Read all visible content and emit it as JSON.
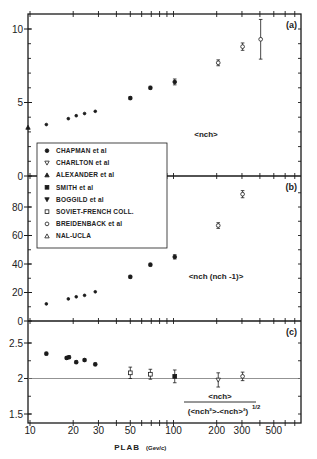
{
  "chart_data": [
    {
      "panel": "(a)",
      "type": "scatter",
      "xscale": "log",
      "xlabel": "PLAB (Gev/c)",
      "ylabel": "",
      "annotation": "<nch>",
      "ylim": [
        0,
        10.5
      ],
      "yticks": [
        0,
        5,
        10
      ],
      "xticks": [
        10,
        20,
        30,
        50,
        100,
        200,
        300,
        500
      ],
      "xlim": [
        10,
        800
      ],
      "series": [
        {
          "name": "CHAPMAN et al",
          "marker": "filled-circle",
          "x": [
            13,
            18.5,
            21,
            24,
            28.5
          ],
          "y": [
            3.5,
            3.9,
            4.1,
            4.25,
            4.4
          ]
        },
        {
          "name": "ALEXANDER et al",
          "marker": "filled-triangle",
          "x": [
            10
          ],
          "y": [
            3.3
          ]
        },
        {
          "name": "SOVIET-FRENCH COLL.",
          "marker": "filled-circle",
          "x": [
            50,
            69,
            102
          ],
          "y": [
            5.3,
            6.0,
            6.4
          ],
          "err": [
            0.1,
            0.1,
            0.2
          ]
        },
        {
          "name": "BREIDENBACK et al",
          "marker": "open-circle",
          "x": [
            205,
            303
          ],
          "y": [
            7.7,
            8.8
          ],
          "err": [
            0.2,
            0.25
          ]
        },
        {
          "name": "NAL-UCLA",
          "marker": "open-circle",
          "x": [
            405
          ],
          "y": [
            9.3
          ],
          "err": [
            1.35
          ]
        }
      ]
    },
    {
      "panel": "(b)",
      "type": "scatter",
      "xscale": "log",
      "annotation": "<nch (nch -1)>",
      "ylim": [
        0,
        100
      ],
      "yticks": [
        0,
        20,
        40,
        60,
        80
      ],
      "xticks": [
        10,
        20,
        30,
        50,
        100,
        200,
        300,
        500
      ],
      "series": [
        {
          "name": "CHAPMAN et al",
          "marker": "filled-circle",
          "x": [
            13,
            18.5,
            21,
            24,
            28.5
          ],
          "y": [
            12,
            15.5,
            17,
            18,
            20.5
          ]
        },
        {
          "name": "SOVIET-FRENCH COLL.",
          "marker": "filled-circle",
          "x": [
            50,
            69,
            102
          ],
          "y": [
            31,
            39.5,
            45
          ],
          "err": [
            1,
            1,
            1.5
          ]
        },
        {
          "name": "BREIDENBACK et al",
          "marker": "open-circle",
          "x": [
            205,
            303
          ],
          "y": [
            67,
            89
          ],
          "err": [
            2,
            2.5
          ]
        }
      ]
    },
    {
      "panel": "(c)",
      "type": "scatter",
      "xscale": "log",
      "annotation_num": "<nch>",
      "annotation_den": "(<nch²>-<nch>²)^1/2",
      "ylim": [
        1.37,
        2.75
      ],
      "yticks": [
        1.5,
        2,
        2.5
      ],
      "reference_line_y": 2,
      "xticks": [
        10,
        20,
        30,
        50,
        100,
        200,
        300,
        500
      ],
      "series": [
        {
          "name": "CHAPMAN et al",
          "marker": "filled-circle",
          "x": [
            13,
            18,
            18.7,
            21,
            24,
            28.5
          ],
          "y": [
            2.35,
            2.29,
            2.3,
            2.23,
            2.26,
            2.2
          ],
          "err": [
            0.02,
            0.02,
            0.02,
            0.02,
            0.02,
            0.02
          ]
        },
        {
          "name": "SOVIET-FRENCH COLL.",
          "marker": "open-square",
          "x": [
            50,
            69
          ],
          "y": [
            2.08,
            2.06
          ],
          "err": [
            0.08,
            0.07
          ]
        },
        {
          "name": "SMITH et al",
          "marker": "filled-square",
          "x": [
            102
          ],
          "y": [
            2.03
          ],
          "err": [
            0.09
          ]
        },
        {
          "name": "BOGGILD et al",
          "marker": "open-triangle-down",
          "x": [
            205
          ],
          "y": [
            1.98
          ],
          "err": [
            0.1
          ]
        },
        {
          "name": "BREIDENBACK et al",
          "marker": "open-circle",
          "x": [
            303
          ],
          "y": [
            2.03
          ],
          "err": [
            0.06
          ]
        }
      ]
    }
  ],
  "legend": {
    "items": [
      {
        "marker": "filled-circle",
        "label": "CHAPMAN et al"
      },
      {
        "marker": "open-triangle-down",
        "label": "CHARLTON et al"
      },
      {
        "marker": "filled-triangle",
        "label": "ALEXANDER et al"
      },
      {
        "marker": "filled-square",
        "label": "SMITH et al"
      },
      {
        "marker": "filled-triangle-down",
        "label": "BOGGILD et al"
      },
      {
        "marker": "open-square",
        "label": "SOVIET-FRENCH COLL."
      },
      {
        "marker": "open-circle",
        "label": "BREIDENBACK et al"
      },
      {
        "marker": "open-triangle",
        "label": "NAL-UCLA"
      }
    ]
  },
  "labels": {
    "panel_a": "(a)",
    "panel_b": "(b)",
    "panel_c": "(c)",
    "ann_a": "<nch>",
    "ann_b": "<nch (nch -1)>",
    "ann_c_num": "<nch>",
    "ann_c_den": "(<nch²>-<nch>²)",
    "ann_c_exp": "1/2",
    "x_title_main": "PLAB",
    "x_title_units": "(Gev/c)",
    "x_tick_labels": [
      "10",
      "20",
      "30",
      "50",
      "100",
      "200",
      "300",
      "500"
    ],
    "y_tick_labels_a": [
      "0",
      "5",
      "10"
    ],
    "y_tick_labels_b": [
      "0",
      "20",
      "40",
      "60",
      "80"
    ],
    "y_tick_labels_c": [
      "1.5",
      "2",
      "2.5"
    ]
  },
  "colors": {
    "ink": "#1a1a1a",
    "background": "#ffffff",
    "refline": "#777777"
  }
}
